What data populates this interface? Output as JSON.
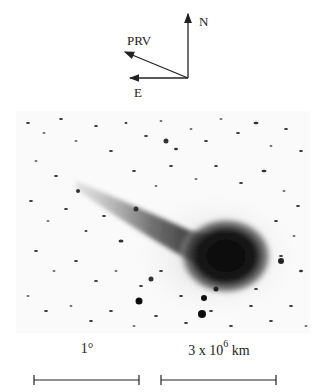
{
  "figure": {
    "compass": {
      "north_label": "N",
      "east_label": "E",
      "prv_label": "PRV"
    },
    "image": {
      "description": "Negative image of comet with bright coma and tail extending to upper left, star field background",
      "colors": {
        "background": "#fafafa",
        "comet": "#111111",
        "stars": "#333333"
      }
    },
    "scale_bars": [
      {
        "label": "1°"
      },
      {
        "label_base": "3 x 10",
        "label_exp": "6",
        "label_unit": "km"
      }
    ]
  }
}
